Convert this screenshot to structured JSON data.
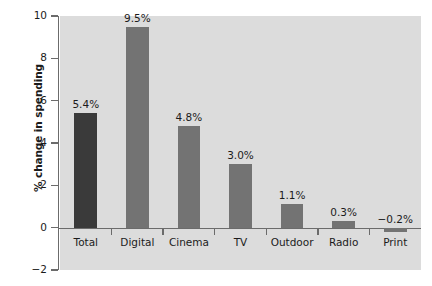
{
  "chart_data": {
    "type": "bar",
    "title": "",
    "subtitle": "",
    "xlabel": "",
    "ylabel": "% change in spending",
    "categories": [
      "Total",
      "Digital",
      "Cinema",
      "TV",
      "Outdoor",
      "Radio",
      "Print"
    ],
    "values": [
      5.4,
      9.5,
      4.8,
      3.0,
      1.1,
      0.3,
      -0.2
    ],
    "value_labels": [
      "5.4%",
      "9.5%",
      "4.8%",
      "3.0%",
      "1.1%",
      "0.3%",
      "−0.2%"
    ],
    "ylim": [
      -2,
      10
    ],
    "yticks": [
      10,
      8,
      6,
      4,
      2,
      0,
      -2
    ],
    "ytick_labels": [
      "10",
      "8",
      "6",
      "4",
      "2",
      "0",
      "−2"
    ],
    "grid": false,
    "legend": "none",
    "bar_colors": [
      "#3a3a3a",
      "#737373",
      "#737373",
      "#737373",
      "#737373",
      "#737373",
      "#737373"
    ],
    "highlight_category": "Total",
    "colors": {
      "panel_background": "#dcdcdc",
      "page_background": "#ffffff",
      "axis": "#6b6b6b",
      "text": "#1b1b1b",
      "bar_default": "#737373",
      "bar_highlight": "#3a3a3a"
    }
  }
}
